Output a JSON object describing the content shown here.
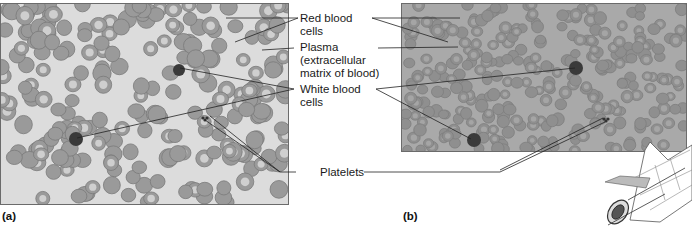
{
  "figure": {
    "panels": [
      {
        "id": "a",
        "label": "(a)",
        "description": "Illustration of blood smear"
      },
      {
        "id": "b",
        "label": "(b)",
        "description": "Micrograph of blood smear"
      }
    ],
    "labels": {
      "red_blood_cells": [
        "Red blood",
        "cells"
      ],
      "plasma": [
        "Plasma",
        "(extracellular",
        "matrix of blood)"
      ],
      "white_blood_cells": [
        "White blood",
        "cells"
      ],
      "platelets": [
        "Platelets"
      ]
    },
    "colors": {
      "illustration_background": "#dcdcdc",
      "rbc_fill": "#9a9a9a",
      "rbc_center": "#cfcfcf",
      "micrograph_background": "#a9a9a9",
      "wbc_fill": "#3a3a3a",
      "leader_line": "#222222"
    }
  }
}
